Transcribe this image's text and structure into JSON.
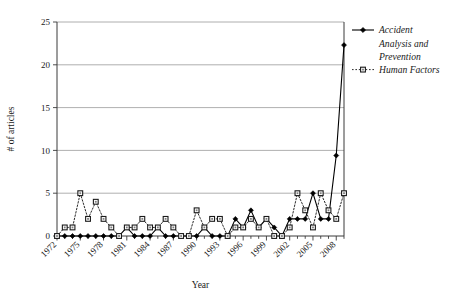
{
  "chart_data": {
    "type": "line",
    "title": "",
    "xlabel": "Year",
    "ylabel": "# of articles",
    "xlim": [
      1972,
      2009
    ],
    "ylim": [
      0,
      25
    ],
    "ytick_values": [
      0,
      5,
      10,
      15,
      20,
      25
    ],
    "ytick_labels": [
      "0",
      "5",
      "10",
      "15",
      "20",
      "25"
    ],
    "xtick_labels": [
      "1972",
      "1975",
      "1978",
      "1981",
      "1984",
      "1987",
      "1990",
      "1993",
      "1996",
      "1999",
      "2002",
      "2005",
      "2008"
    ],
    "xtick_values": [
      1972,
      1975,
      1978,
      1981,
      1984,
      1987,
      1990,
      1993,
      1996,
      1999,
      2002,
      2005,
      2008
    ],
    "grid": "horizontal",
    "legend_position": "right",
    "x": [
      1972,
      1973,
      1974,
      1975,
      1976,
      1977,
      1978,
      1979,
      1980,
      1981,
      1982,
      1983,
      1984,
      1985,
      1986,
      1987,
      1988,
      1989,
      1990,
      1991,
      1992,
      1993,
      1994,
      1995,
      1996,
      1997,
      1998,
      1999,
      2000,
      2001,
      2002,
      2003,
      2004,
      2005,
      2006,
      2007,
      2008,
      2009
    ],
    "series": [
      {
        "name": "Accident Analysis and Prevention",
        "marker": "filled-diamond",
        "linestyle": "solid",
        "color": "#000000",
        "values": [
          0,
          0,
          0,
          0,
          0,
          0,
          0,
          0,
          0,
          1,
          0,
          0,
          0,
          1,
          0,
          0,
          0,
          0,
          0,
          1,
          0,
          0,
          0,
          2,
          1,
          3,
          1,
          2,
          1,
          0,
          2,
          2,
          2,
          5,
          2,
          2,
          9.4,
          22.3
        ]
      },
      {
        "name": "Human Factors",
        "marker": "open-square",
        "linestyle": "dotted",
        "color": "#2a2a2a",
        "values": [
          0,
          1,
          1,
          5,
          2,
          4,
          2,
          1,
          0,
          1,
          1,
          2,
          1,
          1,
          2,
          1,
          0,
          0,
          3,
          1,
          2,
          2,
          0,
          1,
          1,
          2,
          1,
          2,
          0,
          0,
          1,
          5,
          3,
          1,
          5,
          3,
          2,
          5
        ]
      }
    ]
  },
  "legend": {
    "items": [
      {
        "label": "Accident Analysis and Prevention",
        "style": "solid-diamond"
      },
      {
        "label": "Human Factors",
        "style": "dotted-square"
      }
    ]
  },
  "axes": {
    "x_title": "Year",
    "y_title": "# of articles"
  }
}
